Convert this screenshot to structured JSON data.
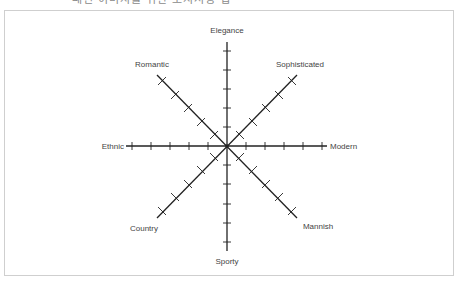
{
  "header": {
    "badge_label": "",
    "title": "패션 이미지를 위한 포지셔닝 맵"
  },
  "diagram": {
    "type": "positioning-map",
    "center": [
      227,
      146
    ],
    "tick_count_per_arm": 5,
    "axes": [
      {
        "name": "vertical",
        "from": "Elegance",
        "to": "Sporty"
      },
      {
        "name": "horizontal",
        "from": "Ethnic",
        "to": "Modern"
      },
      {
        "name": "diagonal-1",
        "from": "Romantic",
        "to": "Mannish"
      },
      {
        "name": "diagonal-2",
        "from": "Sophisticated",
        "to": "Country"
      }
    ],
    "labels": {
      "top": "Elegance",
      "bottom": "Sporty",
      "left": "Ethnic",
      "right": "Modern",
      "top_left": "Romantic",
      "top_right": "Sophisticated",
      "bottom_left": "Country",
      "bottom_right": "Mannish"
    },
    "colors": {
      "axis": "#222222",
      "label": "#444444",
      "frame": "#cfcfcf"
    }
  }
}
